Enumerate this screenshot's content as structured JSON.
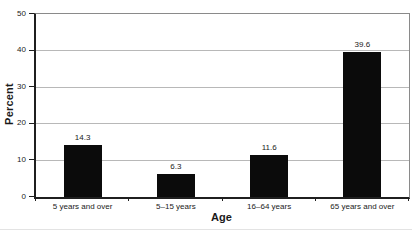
{
  "chart_data": {
    "type": "bar",
    "title": "",
    "categories": [
      "5 years and over",
      "5–15 years",
      "16–64 years",
      "65 years and over"
    ],
    "values": [
      14.3,
      6.3,
      11.6,
      39.6
    ],
    "value_labels": [
      "14.3",
      "6.3",
      "11.6",
      "39.6"
    ],
    "xlabel": "Age",
    "ylabel": "Percent",
    "ylim": [
      0,
      50
    ],
    "yticks": [
      0,
      10,
      20,
      30,
      40,
      50
    ],
    "grid": true,
    "legend": "none",
    "bar_color": "#0b0b0b",
    "colors": {
      "axis": "#1f1f1f",
      "plot_border": "#8a8a8a",
      "gridline": "#b8b8b8",
      "text": "#1a1a1a",
      "background": "#ffffff"
    }
  }
}
